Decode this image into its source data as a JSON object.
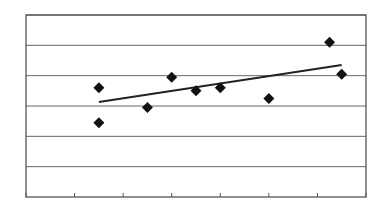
{
  "chart_data": {
    "type": "scatter",
    "title": "",
    "xlabel": "",
    "ylabel": "",
    "xlim": [
      0,
      7
    ],
    "ylim": [
      0,
      6
    ],
    "grid": {
      "horizontal": true,
      "vertical": false
    },
    "x_ticks": [
      0,
      1,
      2,
      3,
      4,
      5,
      6,
      7
    ],
    "y_gridlines": [
      1,
      2,
      3,
      4,
      5,
      6
    ],
    "tick_labels_visible": false,
    "legend": null,
    "series": [
      {
        "name": "points",
        "marker": "diamond",
        "color": "#111111",
        "points": [
          {
            "x": 1.5,
            "y": 3.6
          },
          {
            "x": 1.5,
            "y": 2.45
          },
          {
            "x": 2.5,
            "y": 2.95
          },
          {
            "x": 3.0,
            "y": 3.95
          },
          {
            "x": 3.5,
            "y": 3.5
          },
          {
            "x": 4.0,
            "y": 3.6
          },
          {
            "x": 5.0,
            "y": 3.25
          },
          {
            "x": 6.25,
            "y": 5.1
          },
          {
            "x": 6.5,
            "y": 4.05
          }
        ]
      },
      {
        "name": "trendline",
        "type": "line",
        "color": "#222222",
        "points": [
          {
            "x": 1.5,
            "y": 3.13
          },
          {
            "x": 6.5,
            "y": 4.35
          }
        ]
      }
    ],
    "colors": {
      "frame": "#555555",
      "grid": "#666666",
      "background": "#ffffff"
    }
  }
}
